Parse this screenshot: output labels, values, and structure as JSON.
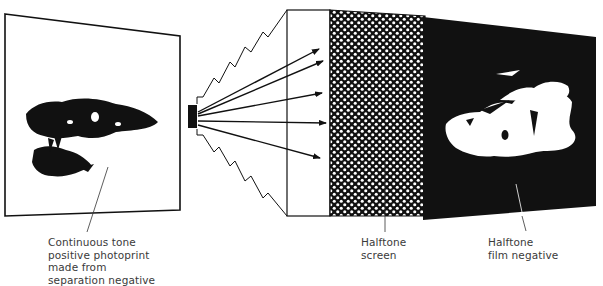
{
  "diagram": {
    "colors": {
      "ink": "#111111",
      "paper": "#ffffff",
      "label_text": "#3a3a3a"
    },
    "components": [
      {
        "id": "photoprint",
        "name": "Continuous tone positive photoprint"
      },
      {
        "id": "camera",
        "name": "Process camera with bellows"
      },
      {
        "id": "lens-board",
        "name": "Lens board"
      },
      {
        "id": "halftone-screen",
        "name": "Halftone screen"
      },
      {
        "id": "film-negative",
        "name": "Halftone film negative"
      }
    ],
    "labels": {
      "photoprint": [
        "Continuous tone",
        "positive photoprint",
        "made from",
        "separation negative"
      ],
      "screen": [
        "Halftone",
        "screen"
      ],
      "negative": [
        "Halftone",
        "film negative"
      ]
    },
    "light_rays": 5
  }
}
